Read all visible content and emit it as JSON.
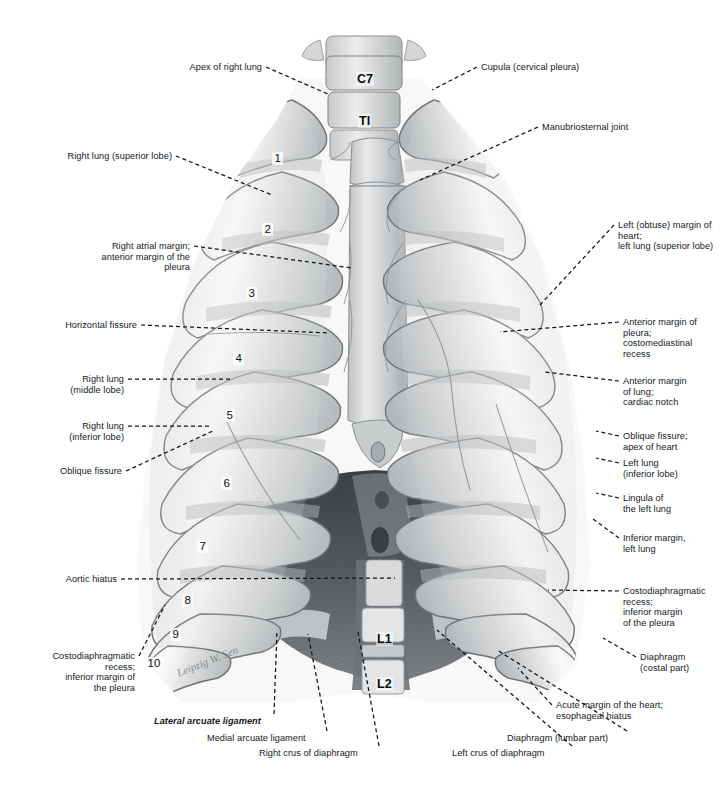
{
  "plate": {
    "title": "Thorax: lungs, pleura and diaphragm (anterior view)",
    "width": 721,
    "height": 793,
    "background_color": "#ffffff",
    "ink_color": "#15181c",
    "artwork_type": "grayscale anatomical illustration",
    "signature": "Leipzig W. Sen"
  },
  "labels_left": [
    {
      "id": "apex-of-right-lung",
      "text": "Apex of right lung",
      "x": 262,
      "y": 62,
      "anchor_x": 262,
      "anchor_y": 67,
      "tip_x": 330,
      "tip_y": 95
    },
    {
      "id": "right-lung-superior-lobe",
      "text": "Right lung (superior lobe)",
      "x": 172,
      "y": 151,
      "anchor_x": 172,
      "anchor_y": 156,
      "tip_x": 272,
      "tip_y": 195
    },
    {
      "id": "right-atrial-margin",
      "text": "Right atrial margin;\nanterior margin of the\npleura",
      "x": 190,
      "y": 241,
      "anchor_x": 190,
      "anchor_y": 246,
      "tip_x": 352,
      "tip_y": 268
    },
    {
      "id": "horizontal-fissure",
      "text": "Horizontal fissure",
      "x": 137,
      "y": 320,
      "anchor_x": 137,
      "anchor_y": 325,
      "tip_x": 330,
      "tip_y": 333
    },
    {
      "id": "right-lung-middle-lobe",
      "text": "Right lung\n(middle lobe)",
      "x": 124,
      "y": 374,
      "anchor_x": 124,
      "anchor_y": 379,
      "tip_x": 233,
      "tip_y": 379
    },
    {
      "id": "right-lung-inferior-lobe",
      "text": "Right lung\n(inferior lobe)",
      "x": 124,
      "y": 421,
      "anchor_x": 124,
      "anchor_y": 426,
      "tip_x": 211,
      "tip_y": 426
    },
    {
      "id": "oblique-fissure",
      "text": "Oblique fissure",
      "x": 122,
      "y": 466,
      "anchor_x": 122,
      "anchor_y": 471,
      "tip_x": 215,
      "tip_y": 430
    },
    {
      "id": "aortic-hiatus",
      "text": "Aortic hiatus",
      "x": 117,
      "y": 574,
      "anchor_x": 117,
      "anchor_y": 579,
      "tip_x": 395,
      "tip_y": 578
    },
    {
      "id": "costodiaphragmatic-recess-right",
      "text": "Costodiaphragmatic\nrecess;\ninferior margin of\nthe pleura",
      "x": 135,
      "y": 651,
      "anchor_x": 135,
      "anchor_y": 656,
      "tip_x": 165,
      "tip_y": 605
    }
  ],
  "labels_right": [
    {
      "id": "cupula-cervical-pleura",
      "text": "Cupula (cervical pleura)",
      "x": 481,
      "y": 62,
      "tip_x": 432,
      "tip_y": 90
    },
    {
      "id": "manubriosternal-joint",
      "text": "Manubriosternal joint",
      "x": 542,
      "y": 122,
      "tip_x": 420,
      "tip_y": 180
    },
    {
      "id": "left-obtuse-margin-of-heart",
      "text": "Left (obtuse) margin of\nheart;\nleft lung (superior lobe)",
      "x": 618,
      "y": 220,
      "tip_x": 540,
      "tip_y": 305
    },
    {
      "id": "anterior-margin-of-pleura",
      "text": "Anterior margin of\npleura;\ncostomediastinal\nrecess",
      "x": 623,
      "y": 317,
      "tip_x": 500,
      "tip_y": 332
    },
    {
      "id": "anterior-margin-of-lung",
      "text": "Anterior margin\nof lung;\ncardiac notch",
      "x": 623,
      "y": 376,
      "tip_x": 545,
      "tip_y": 372
    },
    {
      "id": "oblique-fissure-apex-of-heart",
      "text": "Oblique fissure;\napex of heart",
      "x": 623,
      "y": 431,
      "tip_x": 596,
      "tip_y": 431
    },
    {
      "id": "left-lung-inferior-lobe",
      "text": "Left lung\n(inferior lobe)",
      "x": 623,
      "y": 458,
      "tip_x": 596,
      "tip_y": 458
    },
    {
      "id": "lingula-of-the-left-lung",
      "text": "Lingula of\nthe left lung",
      "x": 623,
      "y": 493,
      "tip_x": 596,
      "tip_y": 493
    },
    {
      "id": "inferior-margin-left-lung",
      "text": "Inferior margin,\nleft lung",
      "x": 623,
      "y": 533,
      "tip_x": 593,
      "tip_y": 519
    },
    {
      "id": "costodiaphragmatic-recess-left",
      "text": "Costodiaphragmatic\nrecess;\ninferior margin\nof the pleura",
      "x": 623,
      "y": 586,
      "tip_x": 548,
      "tip_y": 590
    },
    {
      "id": "diaphragm-costal-part",
      "text": "Diaphragm\n(costal part)",
      "x": 640,
      "y": 652,
      "tip_x": 603,
      "tip_y": 638
    },
    {
      "id": "acute-margin-of-the-heart",
      "text": "Acute margin of the heart;\nesophageal hiatus",
      "x": 556,
      "y": 700,
      "tip_x": 518,
      "tip_y": 668
    }
  ],
  "labels_bottom": [
    {
      "id": "lateral-arcuate-ligament",
      "text": "Lateral arcuate ligament",
      "x": 154,
      "y": 716,
      "align": "left",
      "tip_x": 277,
      "tip_y": 630,
      "italic_bold": true
    },
    {
      "id": "medial-arcuate-ligament",
      "text": "Medial arcuate ligament",
      "x": 207,
      "y": 733,
      "align": "left",
      "tip_x": 308,
      "tip_y": 634,
      "italic_bold": false
    },
    {
      "id": "right-crus-of-diaphragm",
      "text": "Right crus of diaphragm",
      "x": 259,
      "y": 748,
      "align": "left",
      "tip_x": 358,
      "tip_y": 632,
      "italic_bold": false
    },
    {
      "id": "left-crus-of-diaphragm",
      "text": "Left crus of diaphragm",
      "x": 452,
      "y": 748,
      "align": "left",
      "tip_x": 437,
      "tip_y": 630,
      "italic_bold": false
    },
    {
      "id": "diaphragm-lumbar-part",
      "text": "Diaphragm (lumbar part)",
      "x": 507,
      "y": 733,
      "align": "left",
      "tip_x": 497,
      "tip_y": 650,
      "italic_bold": false
    }
  ],
  "rib_numbers": [
    {
      "label": "1",
      "x": 272,
      "y": 152
    },
    {
      "label": "2",
      "x": 262,
      "y": 223
    },
    {
      "label": "3",
      "x": 246,
      "y": 287
    },
    {
      "label": "4",
      "x": 233,
      "y": 352
    },
    {
      "label": "5",
      "x": 224,
      "y": 409
    },
    {
      "label": "6",
      "x": 221,
      "y": 477
    },
    {
      "label": "7",
      "x": 197,
      "y": 540
    },
    {
      "label": "8",
      "x": 182,
      "y": 594
    },
    {
      "label": "9",
      "x": 170,
      "y": 628
    },
    {
      "label": "10",
      "x": 145,
      "y": 657
    }
  ],
  "vertebra_labels": [
    {
      "label": "C7",
      "x": 356,
      "y": 72
    },
    {
      "label": "TI",
      "x": 358,
      "y": 114
    },
    {
      "label": "L1",
      "x": 376,
      "y": 632
    },
    {
      "label": "L2",
      "x": 376,
      "y": 677
    }
  ],
  "icons": {
    "leader_style": "dashed-line",
    "leader_color": "#111417",
    "leader_dash": "4 3"
  }
}
